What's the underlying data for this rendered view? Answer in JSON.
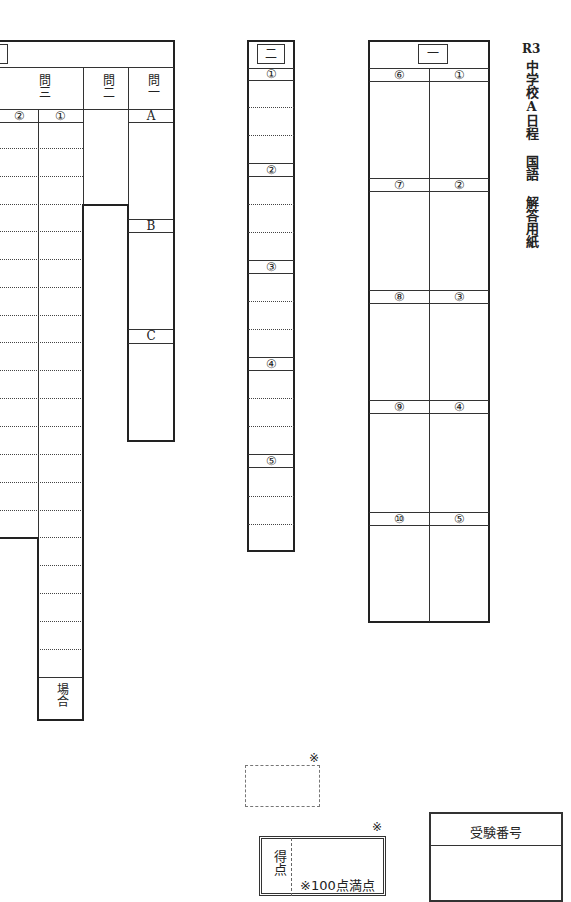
{
  "title": {
    "year": "R3",
    "main": "中学校A日程 国語 解答用紙"
  },
  "section1": {
    "number": "一",
    "items": [
      "①",
      "②",
      "③",
      "④",
      "⑤",
      "⑥",
      "⑦",
      "⑧",
      "⑨",
      "⑩"
    ]
  },
  "section2": {
    "number": "二",
    "items": [
      "①",
      "②",
      "③",
      "④",
      "⑤"
    ]
  },
  "section3": {
    "q1": {
      "label": "問一",
      "parts": [
        "A",
        "B",
        "C"
      ]
    },
    "q2": {
      "label": "問二"
    },
    "q3": {
      "label": "問三",
      "parts": [
        "①",
        "②"
      ],
      "footer": "場合"
    }
  },
  "score": {
    "mark_note": "※",
    "label": "得点",
    "full_marks": "※100点満点"
  },
  "exam_number": {
    "label": "受験番号"
  }
}
